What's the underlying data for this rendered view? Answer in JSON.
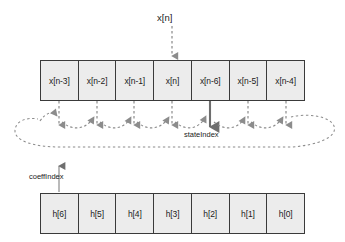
{
  "diagram": {
    "input_label": "x[n]",
    "state_index_label": "stateIndex",
    "coeff_index_label": "coeffIndex",
    "state_buffer": {
      "name": "state-buffer",
      "cells": [
        "x[n-3]",
        "x[n-2]",
        "x[n-1]",
        "x[n]",
        "x[n-6]",
        "x[n-5]",
        "x[n-4]"
      ],
      "pointer_cell_index": 4
    },
    "coeff_buffer": {
      "name": "coefficient-buffer",
      "cells": [
        "h[6]",
        "h[5]",
        "h[4]",
        "h[3]",
        "h[2]",
        "h[1]",
        "h[0]"
      ],
      "pointer_cell_index": 0
    },
    "colors": {
      "cell_fill": "#ececec",
      "cell_border": "#3a3a3a",
      "dashed_arrow": "#8c8c8c",
      "solid_pointer": "#6e6e6e",
      "text": "#1b1b1b",
      "background": "#ffffff"
    }
  }
}
